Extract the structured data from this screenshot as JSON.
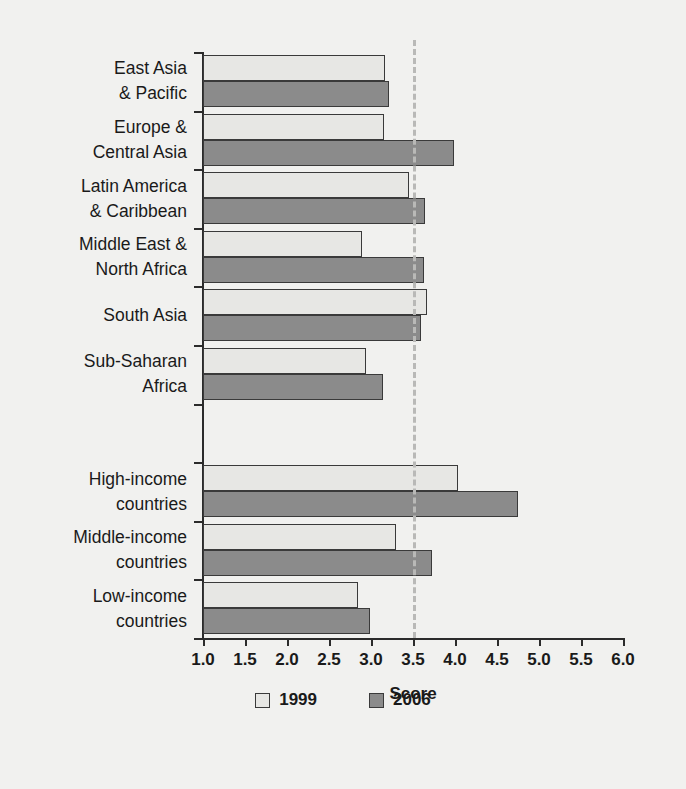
{
  "chart_data": {
    "type": "bar",
    "orientation": "horizontal",
    "title": "",
    "xlabel": "Score",
    "ylabel": "",
    "xlim": [
      1.0,
      6.0
    ],
    "xticks": [
      "1.0",
      "1.5",
      "2.0",
      "2.5",
      "3.0",
      "3.5",
      "4.0",
      "4.5",
      "5.0",
      "5.5",
      "6.0"
    ],
    "grid": false,
    "legend_position": "bottom",
    "reference_line": {
      "value": 3.5,
      "style": "dashed",
      "color": "#b9b9b7"
    },
    "categories": [
      "East Asia\n& Pacific",
      "Europe &\nCentral Asia",
      "Latin America\n& Caribbean",
      "Middle East &\nNorth Africa",
      "South Asia",
      "Sub-Saharan\nAfrica",
      "",
      "High-income\ncountries",
      "Middle-income\ncountries",
      "Low-income\ncountries"
    ],
    "series": [
      {
        "name": "1999",
        "color": "#e7e7e4",
        "values": [
          3.17,
          3.15,
          3.45,
          2.89,
          3.67,
          2.94,
          null,
          4.03,
          3.3,
          2.84
        ]
      },
      {
        "name": "2006",
        "color": "#8b8b8b",
        "values": [
          3.22,
          3.99,
          3.64,
          3.63,
          3.59,
          3.14,
          null,
          4.75,
          3.73,
          2.99
        ]
      }
    ]
  },
  "legend": {
    "items": [
      {
        "label": "1999",
        "color": "#e7e7e4"
      },
      {
        "label": "2006",
        "color": "#8b8b8b"
      }
    ]
  }
}
